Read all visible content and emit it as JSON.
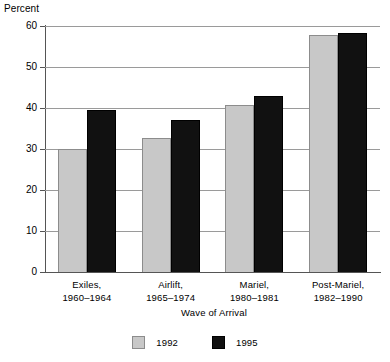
{
  "chart_data": {
    "type": "bar",
    "title": "",
    "xlabel": "Wave of Arrival",
    "ylabel": "Percent",
    "ylim": [
      0,
      60
    ],
    "yticks": [
      0,
      10,
      20,
      30,
      40,
      50,
      60
    ],
    "ytick_labels": [
      "0",
      "10",
      "20",
      "30",
      "40",
      "50",
      "60"
    ],
    "grid": true,
    "legend_position": "bottom-center",
    "categories": [
      "Exiles, 1960–1964",
      "Airlift, 1965–1974",
      "Mariel, 1980–1981",
      "Post-Mariel, 1982–1990"
    ],
    "category_lines": [
      {
        "line1": "Exiles,",
        "line2": "1960–1964"
      },
      {
        "line1": "Airlift,",
        "line2": "1965–1974"
      },
      {
        "line1": "Mariel,",
        "line2": "1980–1981"
      },
      {
        "line1": "Post-Mariel,",
        "line2": "1982–1990"
      }
    ],
    "series": [
      {
        "name": "1992",
        "color": "#c8c8c8",
        "values": [
          30.0,
          32.8,
          40.7,
          57.8
        ]
      },
      {
        "name": "1995",
        "color": "#111111",
        "values": [
          39.4,
          37.0,
          43.0,
          58.3
        ]
      }
    ]
  },
  "legend": {
    "items": [
      {
        "label": "1992",
        "swatch": "light-gray-swatch"
      },
      {
        "label": "1995",
        "swatch": "black-swatch"
      }
    ]
  }
}
